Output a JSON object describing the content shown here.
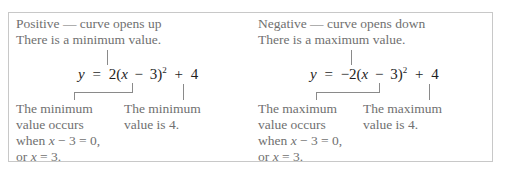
{
  "figure": {
    "positive": {
      "heading": "Positive — curve opens up",
      "subheading": "There is a minimum value.",
      "equation": {
        "lhs": "y",
        "equals": "=",
        "coefficient": "2",
        "open": "(",
        "var": "x",
        "minus": "−",
        "h": "3",
        "close": ")",
        "exp": "2",
        "plus": "+",
        "k": "4"
      },
      "note_left": [
        "The minimum",
        "value occurs",
        "when x − 3 = 0,",
        "or x = 3."
      ],
      "note_right": [
        "The minimum",
        "value is 4."
      ]
    },
    "negative": {
      "heading": "Negative — curve opens down",
      "subheading": "There is a maximum value.",
      "equation": {
        "lhs": "y",
        "equals": "=",
        "coefficient": "−2",
        "open": "(",
        "var": "x",
        "minus": "−",
        "h": "3",
        "close": ")",
        "exp": "2",
        "plus": "+",
        "k": "4"
      },
      "note_left": [
        "The maximum",
        "value occurs",
        "when x − 3 = 0,",
        "or x = 3."
      ],
      "note_right": [
        "The maximum",
        "value is 4."
      ]
    }
  }
}
